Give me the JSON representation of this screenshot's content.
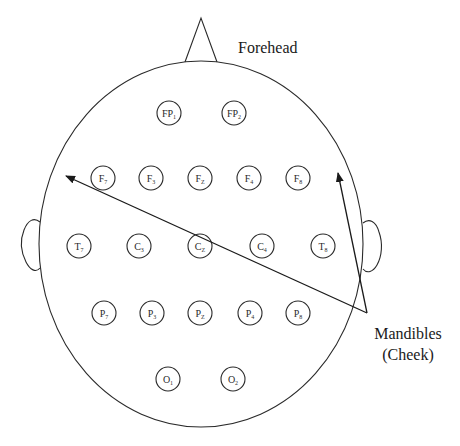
{
  "diagram": {
    "colors": {
      "stroke": "#2a2a2a",
      "background": "#ffffff",
      "text": "#1a1a1a"
    },
    "head": {
      "cx": 201,
      "cy": 244,
      "rx": 162,
      "ry": 183,
      "nose": {
        "apex": [
          201,
          18
        ],
        "left": [
          185,
          62
        ],
        "right": [
          217,
          62
        ]
      },
      "ears": [
        {
          "side": "left",
          "path": "M40,222 C34,217 28,220 24,230 C20,240 21,252 26,262 C30,270 36,273 40,268"
        },
        {
          "side": "right",
          "path": "M363,223 C369,218 376,221 379,232 C383,243 382,256 377,265 C373,272 367,274 363,269"
        }
      ]
    },
    "labels": {
      "forehead": "Forehead",
      "mandibles_line1": "Mandibles",
      "mandibles_line2": "(Cheek)"
    },
    "electrodes": [
      {
        "id": "FP1",
        "base": "FP",
        "sub": "1",
        "x": 169,
        "y": 113
      },
      {
        "id": "FP2",
        "base": "FP",
        "sub": "2",
        "x": 234,
        "y": 113
      },
      {
        "id": "F7",
        "base": "F",
        "sub": "7",
        "x": 103,
        "y": 178
      },
      {
        "id": "F3",
        "base": "F",
        "sub": "3",
        "x": 151,
        "y": 178
      },
      {
        "id": "FZ",
        "base": "F",
        "sub": "Z",
        "x": 200,
        "y": 178
      },
      {
        "id": "F4",
        "base": "F",
        "sub": "4",
        "x": 249,
        "y": 178
      },
      {
        "id": "F8",
        "base": "F",
        "sub": "8",
        "x": 298,
        "y": 178
      },
      {
        "id": "T7",
        "base": "T",
        "sub": "7",
        "x": 79,
        "y": 246
      },
      {
        "id": "C3",
        "base": "C",
        "sub": "3",
        "x": 139,
        "y": 246
      },
      {
        "id": "CZ",
        "base": "C",
        "sub": "Z",
        "x": 200,
        "y": 246
      },
      {
        "id": "C4",
        "base": "C",
        "sub": "4",
        "x": 262,
        "y": 246
      },
      {
        "id": "T8",
        "base": "T",
        "sub": "8",
        "x": 323,
        "y": 246
      },
      {
        "id": "P7",
        "base": "P",
        "sub": "7",
        "x": 104,
        "y": 313
      },
      {
        "id": "P3",
        "base": "P",
        "sub": "3",
        "x": 152,
        "y": 313
      },
      {
        "id": "PZ",
        "base": "P",
        "sub": "Z",
        "x": 200,
        "y": 313
      },
      {
        "id": "P4",
        "base": "P",
        "sub": "4",
        "x": 250,
        "y": 313
      },
      {
        "id": "P8",
        "base": "P",
        "sub": "8",
        "x": 298,
        "y": 313
      },
      {
        "id": "O1",
        "base": "O",
        "sub": "1",
        "x": 168,
        "y": 379
      },
      {
        "id": "O2",
        "base": "O",
        "sub": "2",
        "x": 233,
        "y": 379
      }
    ],
    "electrode_radius": 12,
    "arrows": [
      {
        "name": "arrow-to-left-mandible",
        "from": [
          367,
          313
        ],
        "to": [
          66,
          176
        ]
      },
      {
        "name": "arrow-to-right-mandible",
        "from": [
          367,
          313
        ],
        "to": [
          338,
          173
        ]
      }
    ]
  }
}
